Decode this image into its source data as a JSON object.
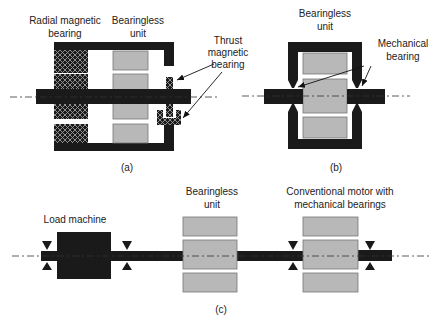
{
  "figure": {
    "panel_a": {
      "caption": "(a)",
      "labels": {
        "radial_line1": "Radial magnetic",
        "radial_line2": "bearing",
        "bearingless_line1": "Bearingless",
        "bearingless_line2": "unit",
        "thrust_line1": "Thrust",
        "thrust_line2": "magnetic",
        "thrust_line3": "bearing"
      }
    },
    "panel_b": {
      "caption": "(b)",
      "labels": {
        "bearingless_line1": "Bearingless",
        "bearingless_line2": "unit",
        "mechanical_line1": "Mechanical",
        "mechanical_line2": "bearing"
      }
    },
    "panel_c": {
      "caption": "(c)",
      "labels": {
        "load_machine": "Load machine",
        "bearingless_line1": "Bearingless",
        "bearingless_line2": "unit",
        "conventional_line1": "Conventional motor with",
        "conventional_line2": "mechanical bearings"
      }
    },
    "colors": {
      "dark": "#1a1a1a",
      "gray": "#b8b8b8",
      "background": "#ffffff"
    }
  }
}
